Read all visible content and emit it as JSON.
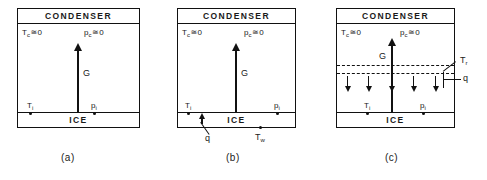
{
  "figure": {
    "type": "schematic-diagram",
    "panel_count": 3,
    "colors": {
      "ink": "#111111",
      "background": "#ffffff"
    },
    "symbols": {
      "approximately_equal": "≅",
      "zero": "0"
    }
  },
  "panels": [
    {
      "id": "a",
      "caption": "(a)",
      "top_band_label": "CONDENSER",
      "bottom_band_label": "ICE",
      "labels": {
        "temp_condenser": "T",
        "temp_condenser_sub": "c",
        "temp_condenser_value": "0",
        "pres_condenser": "p",
        "pres_condenser_sub": "c",
        "pres_condenser_value": "0",
        "temp_interface": "T",
        "temp_interface_sub": "i",
        "pres_interface": "p",
        "pres_interface_sub": "i",
        "flux_G": "G"
      }
    },
    {
      "id": "b",
      "caption": "(b)",
      "top_band_label": "CONDENSER",
      "bottom_band_label": "ICE",
      "labels": {
        "temp_condenser": "T",
        "temp_condenser_sub": "c",
        "temp_condenser_value": "0",
        "pres_condenser": "p",
        "pres_condenser_sub": "c",
        "pres_condenser_value": "0",
        "temp_interface": "T",
        "temp_interface_sub": "i",
        "pres_interface": "p",
        "pres_interface_sub": "i",
        "flux_G": "G",
        "heat_flux_q": "q",
        "temp_wall": "T",
        "temp_wall_sub": "w"
      }
    },
    {
      "id": "c",
      "caption": "(c)",
      "top_band_label": "CONDENSER",
      "bottom_band_label": "ICE",
      "labels": {
        "temp_condenser": "T",
        "temp_condenser_sub": "c",
        "temp_condenser_value": "0",
        "pres_condenser": "p",
        "pres_condenser_sub": "c",
        "pres_condenser_value": "0",
        "temp_interface": "T",
        "temp_interface_sub": "i",
        "pres_interface": "p",
        "pres_interface_sub": "i",
        "flux_G": "G",
        "heat_flux_q": "q",
        "temp_radiant": "T",
        "temp_radiant_sub": "r"
      },
      "down_arrow_count": 5,
      "dashed_line_count": 2
    }
  ]
}
